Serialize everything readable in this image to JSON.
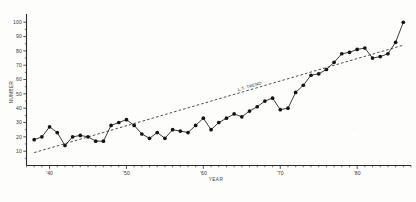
{
  "chart_data": {
    "type": "line",
    "title": "",
    "subtitle": "",
    "xlabel": "YEAR",
    "ylabel": "NUMBER",
    "xlim": [
      37,
      87
    ],
    "ylim": [
      0,
      104
    ],
    "grid": false,
    "legend_position": "none",
    "x_ticks_major": [
      40,
      50,
      60,
      70,
      80
    ],
    "x_ticklabels": [
      "'40",
      "'50",
      "'60",
      "'70",
      "'80"
    ],
    "x_tick_step_minor": 1,
    "y_ticks_major": [
      10,
      20,
      30,
      40,
      50,
      60,
      70,
      80,
      90,
      100
    ],
    "y_ticklabels": [
      "10",
      "20",
      "30",
      "40",
      "50",
      "60",
      "70",
      "80",
      "90",
      "100"
    ],
    "series": [
      {
        "name": "Annual number",
        "style": "line-with-markers",
        "color": "#141414",
        "x": [
          38,
          39,
          40,
          41,
          42,
          43,
          44,
          45,
          46,
          47,
          48,
          49,
          50,
          51,
          52,
          53,
          54,
          55,
          56,
          57,
          58,
          59,
          60,
          61,
          62,
          63,
          64,
          65,
          66,
          67,
          68,
          69,
          70,
          71,
          72,
          73,
          74,
          75,
          76,
          77,
          78,
          79,
          80,
          81,
          82,
          83,
          84,
          85,
          86
        ],
        "values": [
          18,
          20,
          27,
          23,
          14,
          20,
          21,
          20,
          17,
          17,
          28,
          30,
          32,
          28,
          22,
          19,
          23,
          19,
          25,
          24,
          23,
          28,
          33,
          25,
          30,
          33,
          36,
          34,
          38,
          41,
          45,
          47,
          39,
          40,
          51,
          56,
          63,
          64,
          67,
          72,
          78,
          79,
          81,
          82,
          75,
          76,
          78,
          86,
          100
        ]
      },
      {
        "name": "L.T. TREND",
        "style": "dashed-trend",
        "color": "#232323",
        "x": [
          38,
          86
        ],
        "values": [
          9,
          84
        ],
        "annotation": "L.T. TREND"
      }
    ]
  },
  "annotations": {
    "trend_label": "L.T. TREND"
  }
}
